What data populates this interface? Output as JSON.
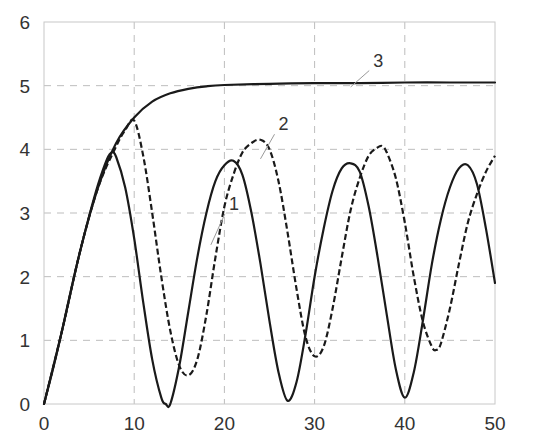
{
  "chart_data": {
    "type": "line",
    "title": "",
    "xlabel": "",
    "ylabel": "",
    "xlim": [
      0,
      50
    ],
    "ylim": [
      0,
      6
    ],
    "grid": true,
    "legend": "none (curves labeled inline 1, 2, 3)",
    "x_ticks": [
      "0",
      "10",
      "20",
      "30",
      "40",
      "50"
    ],
    "y_ticks": [
      "0",
      "1",
      "2",
      "3",
      "4",
      "5",
      "6"
    ],
    "series": [
      {
        "name": "1",
        "style": "solid",
        "points": [
          [
            0,
            0
          ],
          [
            1,
            0.55
          ],
          [
            2,
            1.15
          ],
          [
            3,
            1.8
          ],
          [
            4,
            2.4
          ],
          [
            5,
            2.95
          ],
          [
            6,
            3.45
          ],
          [
            7,
            3.85
          ],
          [
            7.5,
            3.95
          ],
          [
            8,
            3.88
          ],
          [
            9,
            3.4
          ],
          [
            10,
            2.6
          ],
          [
            11,
            1.6
          ],
          [
            12,
            0.7
          ],
          [
            13,
            0.1
          ],
          [
            13.5,
            0
          ],
          [
            14,
            0
          ],
          [
            15,
            0.6
          ],
          [
            16,
            1.45
          ],
          [
            17,
            2.3
          ],
          [
            18,
            3.0
          ],
          [
            19,
            3.5
          ],
          [
            20,
            3.75
          ],
          [
            21,
            3.82
          ],
          [
            22,
            3.6
          ],
          [
            23,
            3.0
          ],
          [
            24,
            2.2
          ],
          [
            25,
            1.3
          ],
          [
            26,
            0.5
          ],
          [
            27,
            0.05
          ],
          [
            28,
            0.35
          ],
          [
            29,
            1.1
          ],
          [
            30,
            2.0
          ],
          [
            31,
            2.75
          ],
          [
            32,
            3.35
          ],
          [
            33,
            3.7
          ],
          [
            34,
            3.78
          ],
          [
            35,
            3.65
          ],
          [
            36,
            3.1
          ],
          [
            37,
            2.3
          ],
          [
            38,
            1.4
          ],
          [
            39,
            0.55
          ],
          [
            40,
            0.1
          ],
          [
            41,
            0.5
          ],
          [
            42,
            1.3
          ],
          [
            43,
            2.2
          ],
          [
            44,
            2.9
          ],
          [
            45,
            3.4
          ],
          [
            46,
            3.7
          ],
          [
            47,
            3.75
          ],
          [
            48,
            3.45
          ],
          [
            49,
            2.75
          ],
          [
            50,
            1.9
          ]
        ]
      },
      {
        "name": "2",
        "style": "dashed",
        "points": [
          [
            0,
            0
          ],
          [
            2,
            1.15
          ],
          [
            4,
            2.4
          ],
          [
            6,
            3.4
          ],
          [
            8,
            4.05
          ],
          [
            9,
            4.3
          ],
          [
            10,
            4.45
          ],
          [
            11,
            3.9
          ],
          [
            12,
            3.0
          ],
          [
            13,
            2.0
          ],
          [
            14,
            1.15
          ],
          [
            15,
            0.6
          ],
          [
            16,
            0.45
          ],
          [
            17,
            0.7
          ],
          [
            18,
            1.4
          ],
          [
            19,
            2.3
          ],
          [
            20,
            3.1
          ],
          [
            21,
            3.6
          ],
          [
            22,
            3.95
          ],
          [
            23,
            4.1
          ],
          [
            24,
            4.15
          ],
          [
            25,
            4.0
          ],
          [
            26,
            3.5
          ],
          [
            27,
            2.7
          ],
          [
            28,
            1.8
          ],
          [
            29,
            1.05
          ],
          [
            30,
            0.75
          ],
          [
            31,
            0.9
          ],
          [
            32,
            1.5
          ],
          [
            33,
            2.3
          ],
          [
            34,
            3.05
          ],
          [
            35,
            3.55
          ],
          [
            36,
            3.9
          ],
          [
            37,
            4.03
          ],
          [
            37.5,
            4.05
          ],
          [
            38,
            3.95
          ],
          [
            39,
            3.55
          ],
          [
            40,
            2.85
          ],
          [
            41,
            2.0
          ],
          [
            42,
            1.3
          ],
          [
            43,
            0.9
          ],
          [
            43.5,
            0.85
          ],
          [
            44,
            0.95
          ],
          [
            45,
            1.5
          ],
          [
            46,
            2.2
          ],
          [
            47,
            2.85
          ],
          [
            48,
            3.3
          ],
          [
            49,
            3.65
          ],
          [
            50,
            3.9
          ]
        ]
      },
      {
        "name": "3",
        "style": "solid",
        "points": [
          [
            0,
            0
          ],
          [
            2,
            1.15
          ],
          [
            4,
            2.4
          ],
          [
            6,
            3.4
          ],
          [
            8,
            4.1
          ],
          [
            10,
            4.5
          ],
          [
            12,
            4.75
          ],
          [
            14,
            4.88
          ],
          [
            16,
            4.95
          ],
          [
            18,
            4.99
          ],
          [
            20,
            5.01
          ],
          [
            25,
            5.03
          ],
          [
            30,
            5.04
          ],
          [
            35,
            5.04
          ],
          [
            40,
            5.05
          ],
          [
            45,
            5.05
          ],
          [
            50,
            5.05
          ]
        ]
      }
    ],
    "annotations": [
      {
        "text": "1",
        "x": 20.5,
        "y": 3.05,
        "leader_to": [
          18.5,
          2.5
        ]
      },
      {
        "text": "2",
        "x": 26,
        "y": 4.3,
        "leader_to": [
          24,
          3.85
        ]
      },
      {
        "text": "3",
        "x": 36.5,
        "y": 5.3,
        "leader_to": [
          34,
          4.98
        ]
      }
    ]
  },
  "colors": {
    "curve": "#1a1a1a",
    "grid": "#bdbdbd",
    "axis": "#c8c8c8",
    "text": "#333333"
  }
}
